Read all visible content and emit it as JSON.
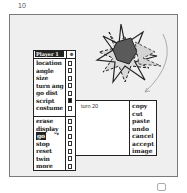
{
  "page": {
    "number": "10"
  },
  "player_menu": {
    "title": "Player 1",
    "header_icon": "eye-icon",
    "items": [
      {
        "label": "location",
        "checked": false,
        "selected": false
      },
      {
        "label": "angle",
        "checked": false,
        "selected": false
      },
      {
        "label": "size",
        "checked": false,
        "selected": false
      },
      {
        "label": "turn ang",
        "checked": false,
        "selected": false
      },
      {
        "label": "go dist",
        "checked": false,
        "selected": false
      },
      {
        "label": "script",
        "checked": true,
        "selected": false
      },
      {
        "label": "costume",
        "checked": false,
        "selected": false
      },
      {
        "label": "erase",
        "checked": false,
        "selected": false
      },
      {
        "label": "display",
        "checked": false,
        "selected": false
      },
      {
        "label": "go",
        "checked": false,
        "selected": true
      },
      {
        "label": "stop",
        "checked": false,
        "selected": false
      },
      {
        "label": "reset",
        "checked": false,
        "selected": false
      },
      {
        "label": "twin",
        "checked": false,
        "selected": false
      },
      {
        "label": "more",
        "checked": false,
        "selected": false
      }
    ]
  },
  "script_panel": {
    "text": "turn 20",
    "menu": [
      "copy",
      "cut",
      "paste",
      "undo",
      "cancel",
      "accept",
      "image"
    ]
  },
  "cursor": {
    "glyph": "➘"
  },
  "colors": {
    "frame_bg": "#efefef",
    "ink": "#222222",
    "star_fill": "#5a5a5a"
  }
}
